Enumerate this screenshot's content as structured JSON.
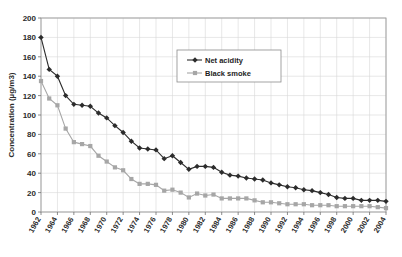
{
  "chart_data": {
    "type": "line",
    "title": "",
    "xlabel": "",
    "ylabel": "Concentration (µg/m3)",
    "ylim": [
      0,
      200
    ],
    "ytick_step": 20,
    "yticks": [
      0,
      20,
      40,
      60,
      80,
      100,
      120,
      140,
      160,
      180,
      200
    ],
    "grid": true,
    "legend_position": "upper-center",
    "x": [
      1962,
      1963,
      1964,
      1965,
      1966,
      1967,
      1968,
      1969,
      1970,
      1971,
      1972,
      1973,
      1974,
      1975,
      1976,
      1977,
      1978,
      1979,
      1980,
      1981,
      1982,
      1983,
      1984,
      1985,
      1986,
      1987,
      1988,
      1989,
      1990,
      1991,
      1992,
      1993,
      1994,
      1995,
      1996,
      1997,
      1998,
      1999,
      2000,
      2001,
      2002,
      2003,
      2004
    ],
    "xtick_labels": [
      "1962",
      "1964",
      "1966",
      "1968",
      "1970",
      "1972",
      "1974",
      "1976",
      "1978",
      "1980",
      "1982",
      "1984",
      "1986",
      "1988",
      "1990",
      "1992",
      "1994",
      "1996",
      "1998",
      "2000",
      "2002",
      "2004"
    ],
    "series": [
      {
        "name": "Net acidity",
        "color": "#2c2c2c",
        "marker": "diamond",
        "values": [
          180,
          147,
          140,
          120,
          111,
          110,
          109,
          102,
          97,
          89,
          82,
          73,
          66,
          65,
          64,
          55,
          58,
          51,
          44,
          47,
          47,
          46,
          41,
          38,
          37,
          35,
          34,
          33,
          30,
          28,
          26,
          25,
          23,
          22,
          20,
          18,
          15,
          14,
          14,
          12,
          12,
          12,
          11
        ]
      },
      {
        "name": "Black smoke",
        "color": "#a6a6a6",
        "marker": "square",
        "values": [
          135,
          117,
          110,
          86,
          72,
          70,
          68,
          58,
          52,
          46,
          43,
          34,
          29,
          29,
          28,
          22,
          23,
          20,
          15,
          19,
          17,
          18,
          14,
          14,
          14,
          14,
          12,
          10,
          10,
          9,
          8,
          8,
          8,
          7,
          7,
          7,
          6,
          6,
          6,
          6,
          6,
          5,
          4
        ]
      }
    ]
  },
  "legend": {
    "items": [
      {
        "label": "Net acidity"
      },
      {
        "label": "Black smoke"
      }
    ]
  }
}
